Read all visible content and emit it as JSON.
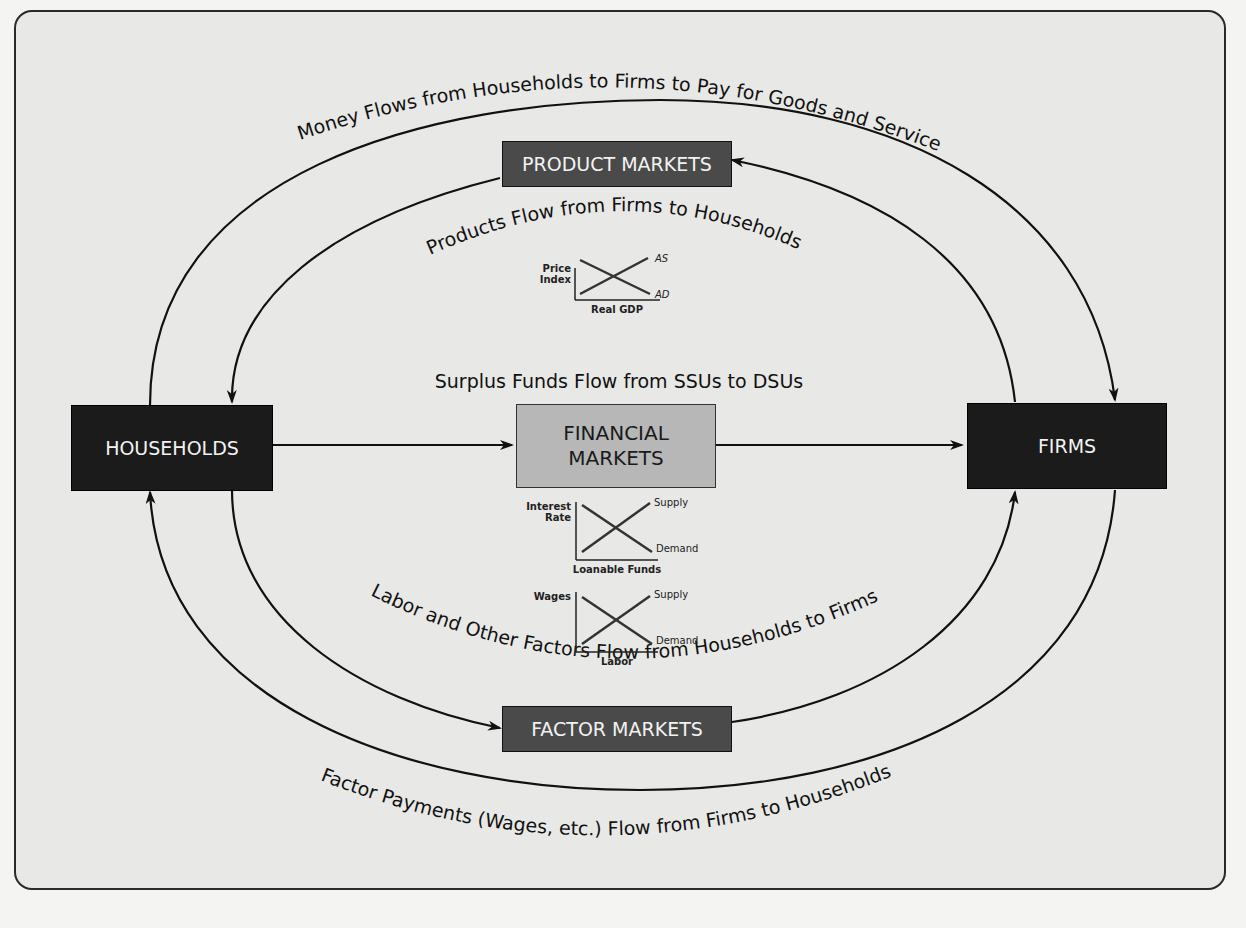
{
  "diagram": {
    "nodes": {
      "households": "HOUSEHOLDS",
      "firms": "FIRMS",
      "product_markets": "PRODUCT MARKETS",
      "factor_markets": "FACTOR MARKETS",
      "financial_markets_line1": "FINANCIAL",
      "financial_markets_line2": "MARKETS"
    },
    "flows": {
      "money_outer_top": "Money Flows from Households to Firms to Pay for Goods and Services",
      "products_inner_top": "Products Flow from Firms to Households",
      "surplus_funds": "Surplus Funds Flow from SSUs to DSUs",
      "labor_inner_bottom": "Labor and Other Factors Flow from Households to Firms",
      "factor_payments_outer_bottom": "Factor Payments (Wages, etc.) Flow from Firms to Households"
    },
    "mini_charts": {
      "product": {
        "ylabel_1": "Price",
        "ylabel_2": "Index",
        "xlabel": "Real GDP",
        "curve_up": "AS",
        "curve_down": "AD"
      },
      "loanable": {
        "ylabel_1": "Interest",
        "ylabel_2": "Rate",
        "xlabel": "Loanable Funds",
        "curve_up": "Supply",
        "curve_down": "Demand"
      },
      "labor": {
        "ylabel_1": "Wages",
        "xlabel": "Labor",
        "curve_up": "Supply",
        "curve_down": "Demand"
      }
    },
    "colors": {
      "dark_box": "#1b1b1b",
      "mid_box": "#4a4a4a",
      "light_box": "#b7b7b7",
      "background": "#e8e8e6"
    }
  }
}
